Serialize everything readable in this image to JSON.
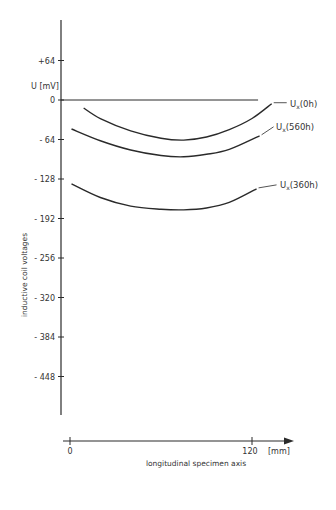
{
  "chart_data": {
    "type": "line",
    "title": "",
    "xlabel": "longitudinal specimen axis",
    "xunit": "[mm]",
    "ylabel": "inductive coil voltages",
    "yunit": "U [mV]",
    "x_ticks": [
      0,
      120
    ],
    "y_ticks": [
      64,
      0,
      -64,
      -128,
      -192,
      -256,
      -320,
      -384,
      -448
    ],
    "y_tick_labels": [
      "+64",
      "0",
      "- 64",
      "- 128",
      "- 192",
      "- 256",
      "- 320",
      "- 384",
      "- 448"
    ],
    "xlim": [
      0,
      145
    ],
    "ylim": [
      -520,
      130
    ],
    "grid": false,
    "legend": "inline labels at right end of each curve",
    "series": [
      {
        "name": "Ux(0h)",
        "label_main": "U",
        "label_sub": "x",
        "label_rest": "(0h)",
        "x": [
          9,
          20,
          40,
          60,
          75,
          90,
          105,
          120,
          133
        ],
        "y": [
          -13,
          -30,
          -50,
          -62,
          -65,
          -60,
          -48,
          -30,
          -6
        ]
      },
      {
        "name": "Ux(560h)",
        "label_main": "U",
        "label_sub": "x",
        "label_rest": "(560h)",
        "x": [
          1,
          20,
          40,
          60,
          75,
          90,
          105,
          125
        ],
        "y": [
          -47,
          -66,
          -81,
          -90,
          -92,
          -88,
          -80,
          -58
        ]
      },
      {
        "name": "Ux(360h)",
        "label_main": "U",
        "label_sub": "x",
        "label_rest": "(360h)",
        "x": [
          1,
          20,
          40,
          60,
          75,
          90,
          105,
          123
        ],
        "y": [
          -136,
          -158,
          -172,
          -177,
          -178,
          -175,
          -166,
          -144
        ]
      }
    ],
    "reference_line": {
      "y": 0,
      "x_range": [
        -6,
        124
      ]
    }
  },
  "layout": {
    "line_color": "#2a2a2a"
  }
}
